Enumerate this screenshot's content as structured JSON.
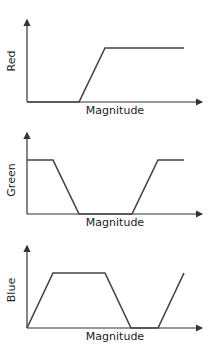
{
  "diagram": {
    "panels": [
      {
        "id": "red",
        "ylabel": "Red",
        "xlabel": "Magnitude",
        "points": [
          [
            27,
            102
          ],
          [
            79,
            102
          ],
          [
            105,
            48
          ],
          [
            184,
            48
          ]
        ]
      },
      {
        "id": "green",
        "ylabel": "Green",
        "xlabel": "Magnitude",
        "points": [
          [
            27,
            160
          ],
          [
            53,
            160
          ],
          [
            79,
            214
          ],
          [
            132,
            214
          ],
          [
            158,
            160
          ],
          [
            184,
            160
          ]
        ]
      },
      {
        "id": "blue",
        "ylabel": "Blue",
        "xlabel": "Magnitude",
        "points": [
          [
            27,
            328
          ],
          [
            53,
            273
          ],
          [
            105,
            273
          ],
          [
            131,
            328
          ],
          [
            158,
            328
          ],
          [
            184,
            273
          ]
        ]
      }
    ],
    "line_color": "#444444",
    "axis_color": "#333333"
  }
}
